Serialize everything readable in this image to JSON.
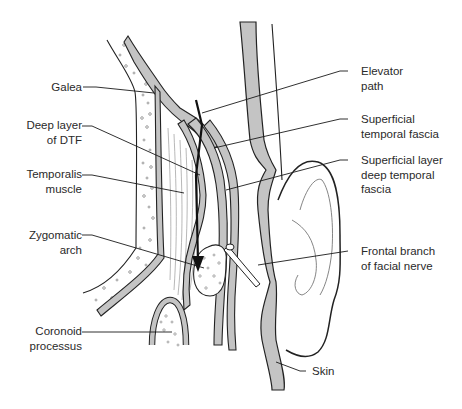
{
  "figure": {
    "colors": {
      "layer_fill": "#c4c4c4",
      "outline": "#222222",
      "leader": "#1a1a1a",
      "text": "#2a2a2a",
      "background": "#ffffff"
    },
    "labels_left": [
      {
        "id": "galea",
        "lines": [
          "Galea"
        ]
      },
      {
        "id": "deep-layer-dtf",
        "lines": [
          "Deep layer",
          "of DTF"
        ]
      },
      {
        "id": "temporalis-muscle",
        "lines": [
          "Temporalis",
          "muscle"
        ]
      },
      {
        "id": "zygomatic-arch",
        "lines": [
          "Zygomatic",
          "arch"
        ]
      },
      {
        "id": "coronoid-process",
        "lines": [
          "Coronoid",
          "processus"
        ]
      }
    ],
    "labels_right": [
      {
        "id": "elevator-path",
        "lines": [
          "Elevator",
          "path"
        ]
      },
      {
        "id": "superficial-temporal-fascia",
        "lines": [
          "Superficial",
          "temporal fascia"
        ]
      },
      {
        "id": "superficial-layer-dtf",
        "lines": [
          "Superficial layer",
          "deep temporal",
          "fascia"
        ]
      },
      {
        "id": "frontal-branch-facial-nerve",
        "lines": [
          "Frontal branch",
          "of facial nerve"
        ]
      },
      {
        "id": "skin",
        "lines": [
          "Skin"
        ]
      }
    ]
  }
}
